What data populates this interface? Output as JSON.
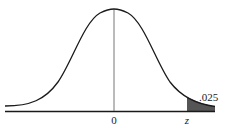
{
  "diagram": {
    "type": "normal-distribution-curve",
    "center_label": "0",
    "critical_label": "z",
    "tail_area_label": ".025",
    "shaded_region": "right-tail",
    "colors": {
      "curve": "#1a1a1a",
      "axis": "#1a1a1a",
      "center_line": "#555555",
      "shade": "#555555",
      "background": "#ffffff"
    }
  }
}
